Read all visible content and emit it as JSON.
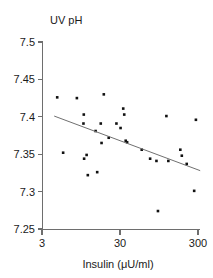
{
  "chart_data": {
    "type": "scatter",
    "title": "",
    "ylabel": "UV pH",
    "xlabel": "Insulin (μU/ml)",
    "xscale": "log",
    "yscale": "linear",
    "xlim": [
      3,
      300
    ],
    "ylim": [
      7.25,
      7.5
    ],
    "grid": false,
    "legend": "none",
    "xticks": [
      3,
      30,
      300
    ],
    "xtick_labels": [
      "3",
      "30",
      "300"
    ],
    "yticks": [
      7.25,
      7.3,
      7.35,
      7.4,
      7.45,
      7.5
    ],
    "ytick_labels": [
      "7.25",
      "7.3",
      "7.35",
      "7.4",
      "7.45",
      "7.5"
    ],
    "series": [
      {
        "name": "Subjects",
        "marker": "square",
        "color": "#111111",
        "points": [
          {
            "x": 4.7,
            "y": 7.426
          },
          {
            "x": 5.6,
            "y": 7.352
          },
          {
            "x": 8.4,
            "y": 7.425
          },
          {
            "x": 10.2,
            "y": 7.391
          },
          {
            "x": 10.3,
            "y": 7.403
          },
          {
            "x": 10.4,
            "y": 7.344
          },
          {
            "x": 11.2,
            "y": 7.349
          },
          {
            "x": 11.6,
            "y": 7.322
          },
          {
            "x": 14.6,
            "y": 7.381
          },
          {
            "x": 15.3,
            "y": 7.326
          },
          {
            "x": 17.0,
            "y": 7.391
          },
          {
            "x": 17.4,
            "y": 7.365
          },
          {
            "x": 18.6,
            "y": 7.43
          },
          {
            "x": 21.5,
            "y": 7.372
          },
          {
            "x": 27.0,
            "y": 7.391
          },
          {
            "x": 30.5,
            "y": 7.385
          },
          {
            "x": 33.0,
            "y": 7.411
          },
          {
            "x": 34.0,
            "y": 7.403
          },
          {
            "x": 35.5,
            "y": 7.368
          },
          {
            "x": 37.0,
            "y": 7.366
          },
          {
            "x": 57.0,
            "y": 7.356
          },
          {
            "x": 73.0,
            "y": 7.344
          },
          {
            "x": 88.0,
            "y": 7.341
          },
          {
            "x": 92.0,
            "y": 7.274
          },
          {
            "x": 118.0,
            "y": 7.401
          },
          {
            "x": 125.0,
            "y": 7.341
          },
          {
            "x": 178.0,
            "y": 7.356
          },
          {
            "x": 186.0,
            "y": 7.348
          },
          {
            "x": 215.0,
            "y": 7.337
          },
          {
            "x": 268.0,
            "y": 7.301
          },
          {
            "x": 282.0,
            "y": 7.396
          }
        ]
      }
    ],
    "trend_line": {
      "name": "Regression line",
      "color": "#707070",
      "x_start": 4.3,
      "y_start": 7.401,
      "x_end": 320.0,
      "y_end": 7.328
    }
  },
  "axes": {
    "y_title": "UV pH",
    "x_title": "Insulin (μU/ml)"
  }
}
